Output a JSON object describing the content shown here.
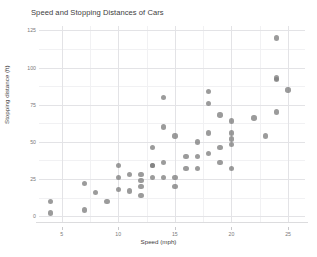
{
  "chart_data": {
    "type": "scatter",
    "title": "Speed and Stopping Distances of Cars",
    "xlabel": "Speed (mph)",
    "ylabel": "Stopping distance (ft)",
    "xlim": [
      3,
      26.5
    ],
    "ylim": [
      -4,
      128
    ],
    "x_ticks": [
      5,
      10,
      15,
      20,
      25
    ],
    "y_ticks": [
      0,
      25,
      50,
      75,
      100,
      125
    ],
    "x_tick_labels": [
      "5",
      "10",
      "15",
      "20",
      "25"
    ],
    "y_tick_labels": [
      "0",
      "25",
      "50",
      "75",
      "100",
      "125"
    ],
    "x_minor_ticks": [
      7.5,
      12.5,
      17.5,
      22.5
    ],
    "y_minor_ticks": [
      12.5,
      37.5,
      62.5,
      87.5,
      112.5
    ],
    "grid": true,
    "legend": "none",
    "point_color": "#7f7f7f",
    "point_opacity": 0.78,
    "point_size": 5.4,
    "panel_background": "#ffffff",
    "grid_major_color": "#e3e3e6",
    "grid_minor_color": "#f1f1f3",
    "n_points": 50,
    "x": [
      4,
      4,
      7,
      7,
      8,
      9,
      10,
      10,
      10,
      11,
      11,
      12,
      12,
      12,
      12,
      13,
      13,
      13,
      13,
      14,
      14,
      14,
      14,
      15,
      15,
      15,
      16,
      16,
      17,
      17,
      17,
      18,
      18,
      18,
      18,
      19,
      19,
      19,
      20,
      20,
      20,
      20,
      20,
      22,
      23,
      24,
      24,
      24,
      24,
      25
    ],
    "y": [
      2,
      10,
      4,
      22,
      16,
      10,
      18,
      26,
      34,
      17,
      28,
      14,
      20,
      24,
      28,
      26,
      34,
      34,
      46,
      26,
      36,
      60,
      80,
      20,
      26,
      54,
      32,
      40,
      32,
      40,
      50,
      42,
      56,
      76,
      84,
      36,
      46,
      68,
      32,
      48,
      52,
      56,
      64,
      66,
      54,
      70,
      92,
      93,
      120,
      85
    ],
    "points": [
      {
        "speed": 4,
        "dist": 2
      },
      {
        "speed": 4,
        "dist": 10
      },
      {
        "speed": 7,
        "dist": 4
      },
      {
        "speed": 7,
        "dist": 22
      },
      {
        "speed": 8,
        "dist": 16
      },
      {
        "speed": 9,
        "dist": 10
      },
      {
        "speed": 10,
        "dist": 18
      },
      {
        "speed": 10,
        "dist": 26
      },
      {
        "speed": 10,
        "dist": 34
      },
      {
        "speed": 11,
        "dist": 17
      },
      {
        "speed": 11,
        "dist": 28
      },
      {
        "speed": 12,
        "dist": 14
      },
      {
        "speed": 12,
        "dist": 20
      },
      {
        "speed": 12,
        "dist": 24
      },
      {
        "speed": 12,
        "dist": 28
      },
      {
        "speed": 13,
        "dist": 26
      },
      {
        "speed": 13,
        "dist": 34
      },
      {
        "speed": 13,
        "dist": 34
      },
      {
        "speed": 13,
        "dist": 46
      },
      {
        "speed": 14,
        "dist": 26
      },
      {
        "speed": 14,
        "dist": 36
      },
      {
        "speed": 14,
        "dist": 60
      },
      {
        "speed": 14,
        "dist": 80
      },
      {
        "speed": 15,
        "dist": 20
      },
      {
        "speed": 15,
        "dist": 26
      },
      {
        "speed": 15,
        "dist": 54
      },
      {
        "speed": 16,
        "dist": 32
      },
      {
        "speed": 16,
        "dist": 40
      },
      {
        "speed": 17,
        "dist": 32
      },
      {
        "speed": 17,
        "dist": 40
      },
      {
        "speed": 17,
        "dist": 50
      },
      {
        "speed": 18,
        "dist": 42
      },
      {
        "speed": 18,
        "dist": 56
      },
      {
        "speed": 18,
        "dist": 76
      },
      {
        "speed": 18,
        "dist": 84
      },
      {
        "speed": 19,
        "dist": 36
      },
      {
        "speed": 19,
        "dist": 46
      },
      {
        "speed": 19,
        "dist": 68
      },
      {
        "speed": 20,
        "dist": 32
      },
      {
        "speed": 20,
        "dist": 48
      },
      {
        "speed": 20,
        "dist": 52
      },
      {
        "speed": 20,
        "dist": 56
      },
      {
        "speed": 20,
        "dist": 64
      },
      {
        "speed": 22,
        "dist": 66
      },
      {
        "speed": 23,
        "dist": 54
      },
      {
        "speed": 24,
        "dist": 70
      },
      {
        "speed": 24,
        "dist": 92
      },
      {
        "speed": 24,
        "dist": 93
      },
      {
        "speed": 24,
        "dist": 120
      },
      {
        "speed": 25,
        "dist": 85
      }
    ]
  }
}
